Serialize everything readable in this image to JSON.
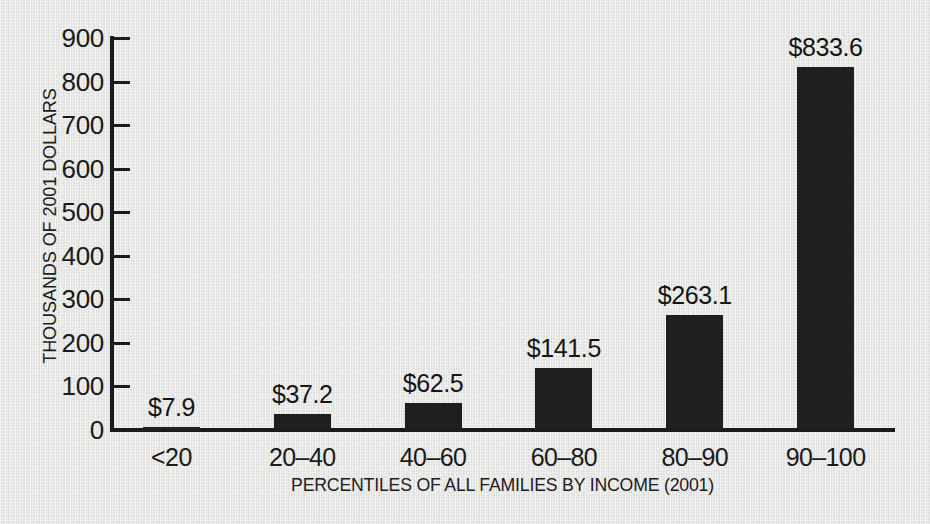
{
  "chart_data": {
    "type": "bar",
    "title": "",
    "subtitle": "",
    "xlabel": "PERCENTILES OF ALL FAMILIES BY INCOME (2001)",
    "ylabel": "THOUSANDS OF 2001 DOLLARS",
    "categories": [
      "<20",
      "20–40",
      "40–60",
      "60–80",
      "80–90",
      "90–100"
    ],
    "values": [
      7.9,
      37.2,
      62.5,
      141.5,
      263.1,
      833.6
    ],
    "data_labels": [
      "$7.9",
      "$37.2",
      "$62.5",
      "$141.5",
      "$263.1",
      "$833.6"
    ],
    "ylim": [
      0,
      900
    ],
    "ytick_values": [
      0,
      100,
      200,
      300,
      400,
      500,
      600,
      700,
      800,
      900
    ],
    "ytick_labels": [
      "0",
      "100",
      "200",
      "300",
      "400",
      "500",
      "600",
      "700",
      "800",
      "900"
    ],
    "ytick_step": 100,
    "grid": false,
    "legend": null,
    "legend_position": "none",
    "series": [
      {
        "name": "Mean family net worth",
        "values": [
          7.9,
          37.2,
          62.5,
          141.5,
          263.1,
          833.6
        ]
      }
    ],
    "annotations": []
  },
  "style": {
    "background_color": "#e7e7e6",
    "bar_color": "#1f1f1f",
    "axis_color": "#1b1b1b",
    "text_color": "#1a1a1a"
  }
}
